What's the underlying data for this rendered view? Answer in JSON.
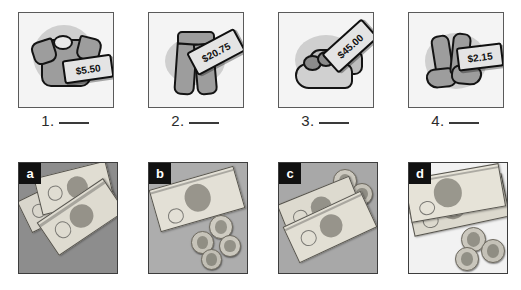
{
  "worksheet": {
    "title": "Money matching worksheet",
    "instruction_blank": "___"
  },
  "items": [
    {
      "number": "1.",
      "blank": "",
      "item_name": "t-shirt",
      "price": "$5.50"
    },
    {
      "number": "2.",
      "blank": "",
      "item_name": "pants",
      "price": "$20.75"
    },
    {
      "number": "3.",
      "blank": "",
      "item_name": "shoes",
      "price": "$45.00"
    },
    {
      "number": "4.",
      "blank": "",
      "item_name": "socks",
      "price": "$2.15"
    }
  ],
  "money_choices": [
    {
      "letter": "a",
      "description": "three overlapping bills, no coins",
      "bill_count": "3",
      "coin_count": "0",
      "background": "#8d8d8d"
    },
    {
      "letter": "b",
      "description": "one five dollar bill and four coins",
      "bill_count": "1",
      "coin_count": "4",
      "background": "#adadad"
    },
    {
      "letter": "c",
      "description": "two one dollar bills and two coins",
      "bill_count": "2",
      "coin_count": "2",
      "background": "#a8a8a8"
    },
    {
      "letter": "d",
      "description": "two ten dollar bills and three coins",
      "bill_count": "2",
      "coin_count": "3",
      "background": "#f2f2f2"
    }
  ],
  "colors": {
    "frame_border": "#5a5a5a",
    "tag_fill": "#e4e4e4",
    "goods_fill": "#9d9d9d",
    "ink": "#101010",
    "badge_bg": "#111111",
    "badge_fg": "#ffffff"
  }
}
